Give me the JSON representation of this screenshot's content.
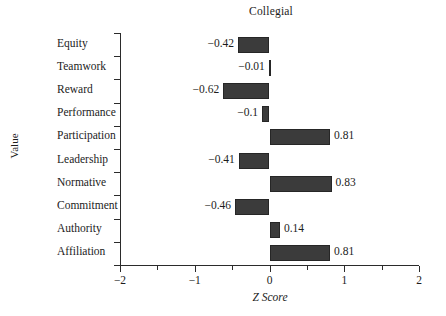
{
  "chart_data": {
    "type": "bar",
    "orientation": "horizontal",
    "title": "Collegial",
    "xlabel": "Z Score",
    "ylabel": "Value",
    "categories": [
      "Equity",
      "Teamwork",
      "Reward",
      "Performance",
      "Participation",
      "Leadership",
      "Normative",
      "Commitment",
      "Authority",
      "Affiliation"
    ],
    "values": [
      -0.42,
      -0.01,
      -0.62,
      -0.1,
      0.81,
      -0.41,
      0.83,
      -0.46,
      0.14,
      0.81
    ],
    "value_labels": [
      "−0.42",
      "−0.01",
      "−0.62",
      "−0.1",
      "0.81",
      "−0.41",
      "0.83",
      "−0.46",
      "0.14",
      "0.81"
    ],
    "xlim": [
      -2,
      2
    ],
    "xticks": [
      -2,
      -1,
      0,
      1,
      2
    ],
    "xtick_labels": [
      "−2",
      "−1",
      "0",
      "1",
      "2"
    ],
    "xticks_minor": [
      -1.5,
      -0.5,
      0.5,
      1.5
    ],
    "grid": false,
    "legend": null,
    "bar_color": "#3b3b3b",
    "bar_edge_color": "#262626",
    "axis_color": "#2b2b2b"
  }
}
